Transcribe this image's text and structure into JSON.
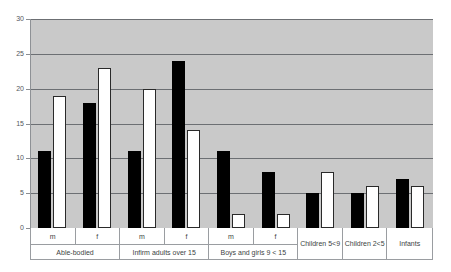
{
  "chart_data": {
    "type": "bar",
    "title": "",
    "subtitle": "",
    "xlabel": "",
    "ylabel": "",
    "ylim": [
      0,
      30
    ],
    "yticks": [
      0,
      5,
      10,
      15,
      20,
      25,
      30
    ],
    "grid": true,
    "legend": "none",
    "categories": [
      "Able-bodied m",
      "Able-bodied f",
      "Infirm adults over 15 m",
      "Infirm adults over 15 f",
      "Boys and girls 9 < 15 m",
      "Boys and girls 9 < 15 f",
      "Children 5<9",
      "Children 2<5",
      "Infants"
    ],
    "series": [
      {
        "name": "black",
        "color": "#000000",
        "values": [
          11,
          18,
          11,
          24,
          11,
          8,
          5,
          5,
          7
        ]
      },
      {
        "name": "white",
        "color": "#ffffff",
        "values": [
          19,
          23,
          20,
          14,
          2,
          2,
          8,
          6,
          6
        ]
      }
    ],
    "groups": [
      {
        "name": "Able-bodied",
        "subcategories": [
          {
            "label": "m",
            "black": 11,
            "white": 19
          },
          {
            "label": "f",
            "black": 18,
            "white": 23
          }
        ]
      },
      {
        "name": "Infirm adults over 15",
        "subcategories": [
          {
            "label": "m",
            "black": 11,
            "white": 20
          },
          {
            "label": "f",
            "black": 24,
            "white": 14
          }
        ]
      },
      {
        "name": "Boys and girls 9 < 15",
        "subcategories": [
          {
            "label": "m",
            "black": 11,
            "white": 2
          },
          {
            "label": "f",
            "black": 8,
            "white": 2
          }
        ]
      },
      {
        "name": "Children 5<9",
        "subcategories": [
          {
            "label": "",
            "black": 5,
            "white": 8
          }
        ]
      },
      {
        "name": "Children 2<5",
        "subcategories": [
          {
            "label": "",
            "black": 5,
            "white": 6
          }
        ]
      },
      {
        "name": "Infants",
        "subcategories": [
          {
            "label": "",
            "black": 7,
            "white": 6
          }
        ]
      }
    ],
    "colors": {
      "plot_background": "#c9c9c9",
      "gridline": "#6c6f73",
      "axis": "#8e9195",
      "bar_black": "#000000",
      "bar_white": "#ffffff",
      "bar_white_border": "#2a2a2a",
      "text": "#3c3f43",
      "page_background": "#ffffff"
    }
  }
}
